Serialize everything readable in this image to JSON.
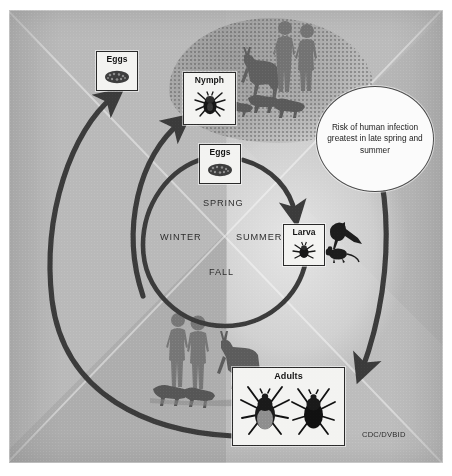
{
  "figure": {
    "credit": "CDC/DVBID"
  },
  "stages": {
    "eggs_outer": {
      "label": "Eggs",
      "icon": "tick-egg-mass-icon"
    },
    "nymph": {
      "label": "Nymph",
      "icon": "nymph-tick-icon"
    },
    "eggs_inner": {
      "label": "Eggs",
      "icon": "tick-egg-mass-icon"
    },
    "larva": {
      "label": "Larva",
      "icon": "larva-tick-icon"
    },
    "adults": {
      "label": "Adults",
      "icon_female": "adult-female-tick-icon",
      "icon_male": "adult-male-tick-icon"
    }
  },
  "callout": {
    "text": "Risk of human infection greatest in late spring and summer"
  },
  "seasons": {
    "spring": "SPRING",
    "summer": "SUMMER",
    "fall": "FALL",
    "winter": "WINTER"
  },
  "hosts": {
    "top_group": [
      "deer-silhouette",
      "human-couple-silhouette",
      "dog-silhouette",
      "rodent-silhouette"
    ],
    "bottom_group": [
      "human-couple-silhouette",
      "deer-silhouette",
      "dog-silhouette"
    ],
    "larva_hosts": [
      "bird-silhouette",
      "mouse-silhouette"
    ]
  },
  "colors": {
    "plate": "#b4b4b4",
    "arrow": "#3b3b3b",
    "box_border": "#2a2a2a",
    "box_fill": "#f3f3f1",
    "bubble_fill": "#fbfbfb",
    "text": "#1a1a1a"
  },
  "arrows": {
    "outer_cycle": "adults-to-eggs-outer",
    "inner_cycle": "eggs-inner-to-larva",
    "nymph_feed": "outer-arc-to-nymph",
    "adults_feed": "outer-arc-to-adults"
  }
}
